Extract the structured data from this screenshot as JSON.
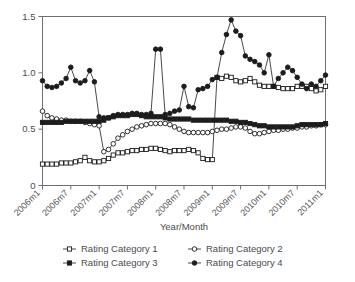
{
  "figure": {
    "clipped_title_fragment": "",
    "background": "#ffffff",
    "ink": "#1c1c1c",
    "axis_color": "#6e6e73"
  },
  "chart_data": {
    "type": "line",
    "title": "",
    "xlabel": "Year/Month",
    "ylabel": "",
    "grid": false,
    "legend_position": "bottom",
    "ylim": [
      0,
      1.5
    ],
    "yticks": [
      0,
      0.5,
      1.0,
      1.5
    ],
    "ytick_labels": [
      "0",
      "0.5",
      "1.0",
      "1.5"
    ],
    "xtick_labels": [
      "2006m1",
      "2006m7",
      "2007m1",
      "2007m7",
      "2008m1",
      "2008m7",
      "2009m1",
      "2009m7",
      "2010m1",
      "2010m7",
      "2011m1"
    ],
    "xtick_indices": [
      0,
      6,
      12,
      18,
      24,
      30,
      36,
      42,
      48,
      54,
      60
    ],
    "x": [
      "2006m1",
      "2006m2",
      "2006m3",
      "2006m4",
      "2006m5",
      "2006m6",
      "2006m7",
      "2006m8",
      "2006m9",
      "2006m10",
      "2006m11",
      "2006m12",
      "2007m1",
      "2007m2",
      "2007m3",
      "2007m4",
      "2007m5",
      "2007m6",
      "2007m7",
      "2007m8",
      "2007m9",
      "2007m10",
      "2007m11",
      "2007m12",
      "2008m1",
      "2008m2",
      "2008m3",
      "2008m4",
      "2008m5",
      "2008m6",
      "2008m7",
      "2008m8",
      "2008m9",
      "2008m10",
      "2008m11",
      "2008m12",
      "2009m1",
      "2009m2",
      "2009m3",
      "2009m4",
      "2009m5",
      "2009m6",
      "2009m7",
      "2009m8",
      "2009m9",
      "2009m10",
      "2009m11",
      "2009m12",
      "2010m1",
      "2010m2",
      "2010m3",
      "2010m4",
      "2010m5",
      "2010m6",
      "2010m7",
      "2010m8",
      "2010m9",
      "2010m10",
      "2010m11",
      "2010m12",
      "2011m1"
    ],
    "series": [
      {
        "name": "Rating Category 1",
        "marker": "open-square",
        "values": [
          0.19,
          0.19,
          0.19,
          0.19,
          0.2,
          0.2,
          0.2,
          0.21,
          0.22,
          0.25,
          0.22,
          0.21,
          0.21,
          0.22,
          0.24,
          0.27,
          0.29,
          0.29,
          0.3,
          0.31,
          0.31,
          0.32,
          0.32,
          0.33,
          0.33,
          0.32,
          0.31,
          0.3,
          0.31,
          0.31,
          0.31,
          0.32,
          0.31,
          0.29,
          0.24,
          0.23,
          0.23,
          0.96,
          0.95,
          0.97,
          0.96,
          0.93,
          0.92,
          0.93,
          0.95,
          0.92,
          0.89,
          0.88,
          0.88,
          0.88,
          0.87,
          0.86,
          0.86,
          0.86,
          0.88,
          0.88,
          0.88,
          0.86,
          0.84,
          0.85,
          0.88
        ]
      },
      {
        "name": "Rating Category 2",
        "marker": "open-circle",
        "values": [
          0.66,
          0.62,
          0.6,
          0.59,
          0.58,
          0.58,
          0.57,
          0.57,
          0.57,
          0.56,
          0.55,
          0.54,
          0.53,
          0.3,
          0.32,
          0.37,
          0.42,
          0.45,
          0.48,
          0.5,
          0.52,
          0.53,
          0.54,
          0.55,
          0.55,
          0.55,
          0.55,
          0.54,
          0.52,
          0.5,
          0.48,
          0.47,
          0.47,
          0.47,
          0.47,
          0.47,
          0.48,
          0.49,
          0.5,
          0.5,
          0.51,
          0.52,
          0.52,
          0.51,
          0.48,
          0.46,
          0.46,
          0.47,
          0.48,
          0.49,
          0.49,
          0.5,
          0.5,
          0.51,
          0.51,
          0.52,
          0.52,
          0.53,
          0.53,
          0.54,
          0.54
        ]
      },
      {
        "name": "Rating Category 3",
        "marker": "filled-square",
        "values": [
          0.56,
          0.56,
          0.56,
          0.56,
          0.56,
          0.57,
          0.57,
          0.57,
          0.57,
          0.57,
          0.57,
          0.57,
          0.57,
          0.58,
          0.6,
          0.61,
          0.62,
          0.62,
          0.62,
          0.63,
          0.63,
          0.62,
          0.61,
          0.61,
          0.61,
          0.61,
          0.6,
          0.59,
          0.59,
          0.59,
          0.59,
          0.59,
          0.58,
          0.58,
          0.58,
          0.58,
          0.58,
          0.58,
          0.58,
          0.58,
          0.57,
          0.57,
          0.56,
          0.56,
          0.55,
          0.54,
          0.53,
          0.53,
          0.52,
          0.52,
          0.52,
          0.52,
          0.52,
          0.52,
          0.53,
          0.54,
          0.54,
          0.54,
          0.54,
          0.54,
          0.55
        ]
      },
      {
        "name": "Rating Category 4",
        "marker": "filled-circle",
        "values": [
          0.93,
          0.88,
          0.87,
          0.88,
          0.91,
          0.95,
          1.05,
          0.93,
          0.91,
          0.93,
          1.02,
          0.92,
          0.61,
          0.6,
          0.6,
          0.62,
          0.63,
          0.63,
          0.63,
          0.64,
          0.64,
          0.63,
          0.63,
          0.64,
          1.21,
          1.21,
          0.63,
          0.64,
          0.66,
          0.67,
          0.88,
          0.7,
          0.69,
          0.85,
          0.86,
          0.88,
          0.94,
          0.96,
          1.18,
          1.34,
          1.47,
          1.37,
          1.33,
          1.15,
          1.12,
          1.1,
          1.07,
          1.0,
          1.16,
          0.88,
          0.95,
          1.0,
          1.05,
          1.02,
          0.96,
          0.9,
          0.86,
          0.9,
          0.88,
          0.93,
          0.98
        ]
      }
    ]
  },
  "legend": {
    "entries": [
      {
        "label": "Rating Category 1",
        "marker": "open-square"
      },
      {
        "label": "Rating Category 2",
        "marker": "open-circle"
      },
      {
        "label": "Rating Category 3",
        "marker": "filled-square"
      },
      {
        "label": "Rating Category 4",
        "marker": "filled-circle"
      }
    ]
  }
}
